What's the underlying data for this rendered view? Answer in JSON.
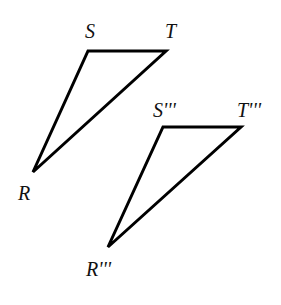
{
  "diagram": {
    "triangles": [
      {
        "name": "original",
        "vertices": {
          "S": [
            88,
            51
          ],
          "T": [
            166,
            51
          ],
          "R": [
            33,
            172
          ]
        },
        "labels": {
          "S": "S",
          "T": "T",
          "R": "R"
        }
      },
      {
        "name": "image",
        "vertices": {
          "S": [
            163,
            127
          ],
          "T": [
            241,
            127
          ],
          "R": [
            108,
            247
          ]
        },
        "labels": {
          "S": "S'''",
          "T": "T'''",
          "R": "R'''"
        }
      }
    ],
    "colors": {
      "stroke": "#000000",
      "background": "#ffffff"
    }
  }
}
